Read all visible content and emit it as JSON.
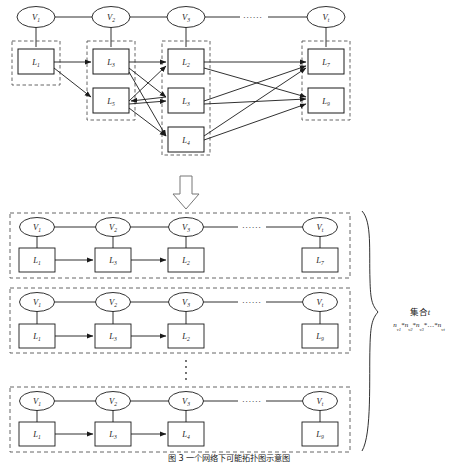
{
  "figure": {
    "caption": "图 3  一个网络下可能拓扑图示意图",
    "top_section": {
      "vertices": [
        {
          "id": "v1",
          "label": "V",
          "sub": "1",
          "x": 36,
          "y": 17
        },
        {
          "id": "v2",
          "label": "V",
          "sub": "2",
          "x": 111,
          "y": 17
        },
        {
          "id": "v3",
          "label": "V",
          "sub": "3",
          "x": 186,
          "y": 17
        },
        {
          "id": "vt",
          "label": "V",
          "sub": "t",
          "x": 326,
          "y": 17
        }
      ],
      "ellipsis": {
        "text": "......",
        "x": 253,
        "y": 17
      },
      "columns": [
        {
          "name": "column-1",
          "x": 12,
          "y": 41,
          "w": 48,
          "h": 44,
          "boxes": [
            {
              "label": "L",
              "sub": "1",
              "x": 36,
              "y": 62
            }
          ]
        },
        {
          "name": "column-2",
          "x": 87,
          "y": 41,
          "w": 48,
          "h": 79,
          "boxes": [
            {
              "label": "L",
              "sub": "3",
              "x": 111,
              "y": 62
            },
            {
              "label": "L",
              "sub": "5",
              "x": 111,
              "y": 101
            }
          ]
        },
        {
          "name": "column-3",
          "x": 162,
          "y": 41,
          "w": 48,
          "h": 114,
          "boxes": [
            {
              "label": "L",
              "sub": "2",
              "x": 186,
              "y": 62
            },
            {
              "label": "L",
              "sub": "3",
              "x": 186,
              "y": 101
            },
            {
              "label": "L",
              "sub": "4",
              "x": 186,
              "y": 140
            }
          ]
        },
        {
          "name": "column-4",
          "x": 302,
          "y": 41,
          "w": 48,
          "h": 79,
          "boxes": [
            {
              "label": "L",
              "sub": "7",
              "x": 326,
              "y": 62
            },
            {
              "label": "L",
              "sub": "9",
              "x": 326,
              "y": 101
            }
          ]
        }
      ]
    },
    "down_arrow": {
      "name": "down-arrow",
      "x": 186,
      "y": 193
    },
    "bottom_groups": [
      {
        "name": "group-1",
        "x": 10,
        "y": 213,
        "w": 340,
        "h": 65,
        "vertices": [
          {
            "label": "V",
            "sub": "1",
            "x": 37,
            "y": 227
          },
          {
            "label": "V",
            "sub": "2",
            "x": 113,
            "y": 227
          },
          {
            "label": "V",
            "sub": "3",
            "x": 186,
            "y": 227
          },
          {
            "label": "V",
            "sub": "t",
            "x": 320,
            "y": 227
          }
        ],
        "ellipsis": {
          "text": "......",
          "x": 253,
          "y": 227
        },
        "boxes": [
          {
            "label": "L",
            "sub": "1",
            "x": 37,
            "y": 260
          },
          {
            "label": "L",
            "sub": "3",
            "x": 113,
            "y": 260
          },
          {
            "label": "L",
            "sub": "2",
            "x": 186,
            "y": 260
          },
          {
            "label": "L",
            "sub": "7",
            "x": 320,
            "y": 260
          }
        ]
      },
      {
        "name": "group-2",
        "x": 10,
        "y": 288,
        "w": 340,
        "h": 65,
        "vertices": [
          {
            "label": "V",
            "sub": "1",
            "x": 37,
            "y": 302
          },
          {
            "label": "V",
            "sub": "2",
            "x": 113,
            "y": 302
          },
          {
            "label": "V",
            "sub": "3",
            "x": 186,
            "y": 302
          },
          {
            "label": "V",
            "sub": "t",
            "x": 320,
            "y": 302
          }
        ],
        "ellipsis": {
          "text": "......",
          "x": 253,
          "y": 302
        },
        "boxes": [
          {
            "label": "L",
            "sub": "1",
            "x": 37,
            "y": 336
          },
          {
            "label": "L",
            "sub": "3",
            "x": 113,
            "y": 336
          },
          {
            "label": "L",
            "sub": "2",
            "x": 186,
            "y": 336
          },
          {
            "label": "L",
            "sub": "9",
            "x": 320,
            "y": 336
          }
        ]
      },
      {
        "name": "group-3",
        "x": 10,
        "y": 387,
        "w": 340,
        "h": 65,
        "vertices": [
          {
            "label": "V",
            "sub": "1",
            "x": 37,
            "y": 401
          },
          {
            "label": "V",
            "sub": "2",
            "x": 113,
            "y": 401
          },
          {
            "label": "V",
            "sub": "3",
            "x": 186,
            "y": 401
          },
          {
            "label": "V",
            "sub": "t",
            "x": 320,
            "y": 401
          }
        ],
        "ellipsis": {
          "text": "......",
          "x": 253,
          "y": 401
        },
        "boxes": [
          {
            "label": "L",
            "sub": "1",
            "x": 37,
            "y": 434
          },
          {
            "label": "L",
            "sub": "3",
            "x": 113,
            "y": 434
          },
          {
            "label": "L",
            "sub": "4",
            "x": 186,
            "y": 434
          },
          {
            "label": "L",
            "sub": "9",
            "x": 320,
            "y": 434
          }
        ]
      }
    ],
    "vertical_ellipsis": {
      "name": "vertical-ellipsis",
      "x": 186,
      "y": 370
    },
    "brace_annotation": {
      "title_cn": "集合",
      "title_var": "t",
      "formula_terms": [
        "n",
        "n",
        "n",
        "n"
      ],
      "formula_subs": [
        "v1",
        "v2",
        "v3",
        "vt"
      ],
      "formula_plain": "n_v1 * n_v2 * n_v3 * ... * n_vt",
      "x": 420,
      "y": 313
    }
  }
}
